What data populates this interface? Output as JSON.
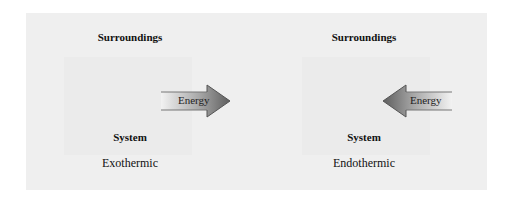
{
  "diagram": {
    "left": {
      "surroundings_label": "Surroundings",
      "system_label": "System",
      "process_label": "Exothermic",
      "arrow": {
        "label": "Energy",
        "direction": "out-of-system (right)"
      }
    },
    "right": {
      "surroundings_label": "Surroundings",
      "system_label": "System",
      "process_label": "Endothermic",
      "arrow": {
        "label": "Energy",
        "direction": "into-system (left)"
      }
    },
    "colors": {
      "panel_background": "#efefef",
      "arrow_light": "#f2f2f2",
      "arrow_dark": "#6a6a6a",
      "text": "#111111"
    }
  }
}
